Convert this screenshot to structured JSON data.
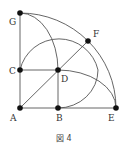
{
  "figure": {
    "caption": "図 4",
    "points": {
      "A": {
        "label": "A",
        "x": 20,
        "y": 108
      },
      "B": {
        "label": "B",
        "x": 58,
        "y": 108
      },
      "E": {
        "label": "E",
        "x": 116,
        "y": 108
      },
      "C": {
        "label": "C",
        "x": 20,
        "y": 70
      },
      "D": {
        "label": "D",
        "x": 58,
        "y": 70
      },
      "G": {
        "label": "G",
        "x": 20,
        "y": 13
      },
      "F": {
        "label": "F",
        "x": 88,
        "y": 41
      }
    },
    "colors": {
      "line": "#555555",
      "dot": "#111111"
    }
  }
}
